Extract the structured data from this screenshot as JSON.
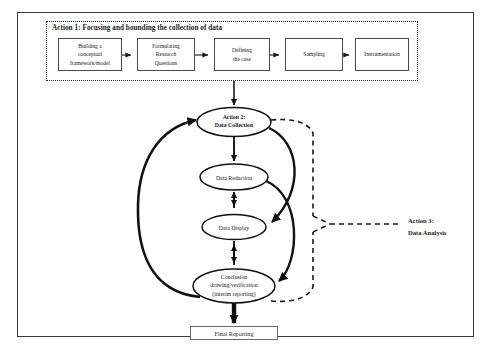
{
  "figure": {
    "scan_caption": "",
    "action3_line1": "Action 3:",
    "action3_line2": "Data Analysis"
  },
  "action1": {
    "title": "Action 1: Focusing and bounding the collection of data",
    "steps": [
      {
        "id": "building-framework",
        "lines": [
          "Building a",
          "conceptual",
          "framework/model"
        ]
      },
      {
        "id": "formulating-questions",
        "lines": [
          "Formulating",
          "Research",
          "Questions"
        ]
      },
      {
        "id": "defining-case",
        "lines": [
          "Defining",
          "the case"
        ]
      },
      {
        "id": "sampling",
        "lines": [
          "Sampling"
        ]
      },
      {
        "id": "instrumentation",
        "lines": [
          "Instrumentation"
        ]
      }
    ]
  },
  "nodes": {
    "data_collection_line1": "Action 2:",
    "data_collection_line2": "Data Collection",
    "data_reduction": "Data Reduction",
    "data_display": "Data Display",
    "conclusion_line1": "Conclusion",
    "conclusion_line2": "drawing/verification",
    "conclusion_line3": "(interim reporting)"
  },
  "output": {
    "final_reporting": "Final Reporting"
  },
  "colors": {
    "frame": "#3a3a3a",
    "box_border": "#4a4a4a",
    "ink": "#1a1a1a",
    "dashed": "#2b2b2b"
  }
}
